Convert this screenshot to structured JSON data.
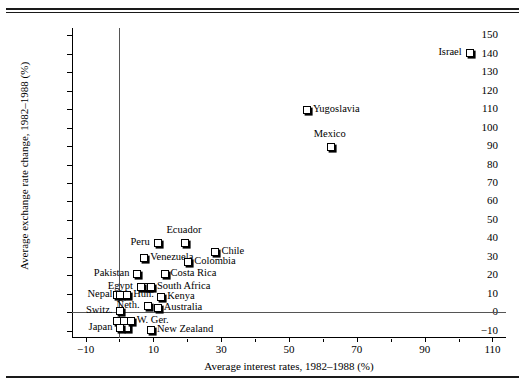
{
  "figure": {
    "name": "scatter-plot-interest-vs-exchange-rate"
  },
  "chart_data": {
    "type": "scatter",
    "title": "",
    "xlabel": "Average interest rates, 1982–1988 (%)",
    "ylabel": "Average exchange rate change, 1982–1988 (%)",
    "xlim": [
      -14,
      114
    ],
    "ylim": [
      -14,
      154
    ],
    "xticks": [
      -10,
      10,
      30,
      50,
      70,
      90,
      110
    ],
    "xtick_labels": [
      "−10",
      "10",
      "30",
      "50",
      "70",
      "90",
      "110"
    ],
    "xminor_ticks": [
      0,
      20,
      40,
      60,
      80,
      100
    ],
    "yticks": [
      -10,
      0,
      10,
      20,
      30,
      40,
      50,
      60,
      70,
      80,
      90,
      100,
      110,
      120,
      130,
      140,
      150
    ],
    "ytick_labels": [
      "−10",
      "0",
      "10",
      "20",
      "30",
      "40",
      "50",
      "60",
      "70",
      "80",
      "90",
      "100",
      "110",
      "120",
      "130",
      "140",
      "150"
    ],
    "grid": false,
    "legend": null,
    "zero_lines": {
      "x": 0,
      "y": 0
    },
    "points": [
      {
        "label": "Israel",
        "x": 103,
        "y": 141,
        "label_pos": "left"
      },
      {
        "label": "Yugoslavia",
        "x": 55,
        "y": 110,
        "label_pos": "right"
      },
      {
        "label": "Mexico",
        "x": 62,
        "y": 90,
        "label_pos": "above"
      },
      {
        "label": "Ecuador",
        "x": 19,
        "y": 38,
        "label_pos": "above"
      },
      {
        "label": "Peru",
        "x": 11,
        "y": 38,
        "label_pos": "left"
      },
      {
        "label": "Chile",
        "x": 28,
        "y": 33,
        "label_pos": "right"
      },
      {
        "label": "Venezuela",
        "x": 7,
        "y": 30,
        "label_pos": "right"
      },
      {
        "label": "Colombia",
        "x": 20,
        "y": 28,
        "label_pos": "right"
      },
      {
        "label": "Pakistan",
        "x": 5,
        "y": 21,
        "label_pos": "left"
      },
      {
        "label": "Costa Rica",
        "x": 13,
        "y": 21,
        "label_pos": "right"
      },
      {
        "label": "Egypt",
        "x": 6,
        "y": 14,
        "label_pos": "left"
      },
      {
        "label": "South Africa",
        "x": 9,
        "y": 14,
        "label_pos": "right"
      },
      {
        "label": "Nepal",
        "x": 0,
        "y": 10,
        "label_pos": "left"
      },
      {
        "label": "Hun.",
        "x": 2,
        "y": 10,
        "label_pos": "right"
      },
      {
        "label": "Kenya",
        "x": 12,
        "y": 9,
        "label_pos": "right"
      },
      {
        "label": "Neth.",
        "x": 8,
        "y": 4,
        "label_pos": "left"
      },
      {
        "label": "Australia",
        "x": 11,
        "y": 3,
        "label_pos": "right"
      },
      {
        "label": "Switz.",
        "x": 0,
        "y": 1,
        "label_pos": "left"
      },
      {
        "label": "W. Ger.",
        "x": 3,
        "y": -4,
        "label_pos": "right"
      },
      {
        "label": "Japan",
        "x": 0,
        "y": -8,
        "label_pos": "left"
      },
      {
        "label": "New Zealand",
        "x": 9,
        "y": -9,
        "label_pos": "right"
      }
    ],
    "extra_markers": [
      {
        "x": -1,
        "y": 10
      },
      {
        "x": -1,
        "y": -4
      },
      {
        "x": 1,
        "y": -4
      },
      {
        "x": 2,
        "y": -8
      },
      {
        "x": 8,
        "y": 14
      }
    ]
  }
}
